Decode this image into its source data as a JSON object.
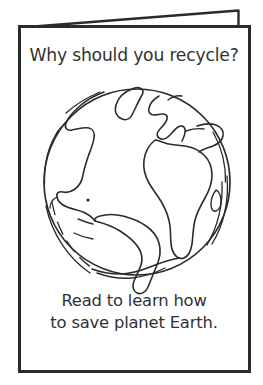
{
  "page": {
    "background_color": "#ffffff",
    "ink_color": "#2b2b2b",
    "text_color": "#323232",
    "width": 263,
    "height": 385
  },
  "card": {
    "kind": "folded-greeting-card-line-drawing",
    "panels": {
      "back_panel_name": "back-panel",
      "front_panel_name": "front-panel"
    }
  },
  "front": {
    "title": "Why should you recycle?",
    "message_lines": [
      "Read to learn how",
      "to save planet Earth."
    ],
    "illustration": {
      "name": "earth-globe-illustration",
      "description": "line-art globe with continents",
      "center_x": 137,
      "center_y": 182,
      "radius": 93,
      "landmasses": [
        "North America",
        "Greenland",
        "South America",
        "Europe",
        "Africa",
        "Asia",
        "Madagascar",
        "Antarctica"
      ]
    }
  }
}
